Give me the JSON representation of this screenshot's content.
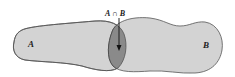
{
  "diagram": {
    "type": "venn",
    "sets": [
      {
        "label": "A",
        "fill": "#d3d3d3"
      },
      {
        "label": "B",
        "fill": "#d3d3d3"
      }
    ],
    "intersection": {
      "label": "A ∩ B",
      "fill": "#8a8a8a"
    },
    "outline_color": "#555555"
  }
}
